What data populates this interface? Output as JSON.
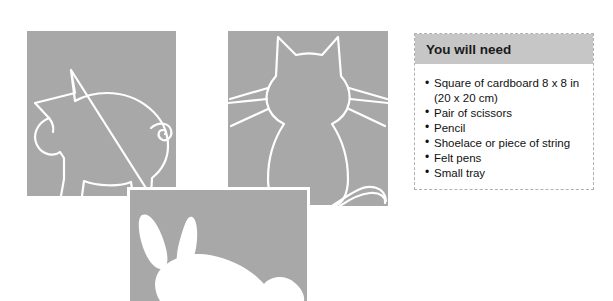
{
  "page": {
    "background_color": "#ffffff",
    "width": 613,
    "height": 301
  },
  "illustrations": {
    "square_fill_color": "#a8a8a8",
    "outline_color": "#ffffff",
    "items": [
      {
        "name": "pig",
        "style": "white-outline-drawing",
        "caption": ""
      },
      {
        "name": "cat",
        "style": "white-outline-drawing",
        "caption": ""
      },
      {
        "name": "rabbit",
        "style": "white-filled-silhouette",
        "caption": ""
      }
    ]
  },
  "materials": {
    "title": "You will need",
    "header_color": "#c6c6c6",
    "border_color": "#b0b0b0",
    "items": [
      {
        "text": "Square of cardboard 8 x 8 in",
        "continuation": "(20 x 20 cm)"
      },
      {
        "text": "Pair of scissors",
        "continuation": ""
      },
      {
        "text": "Pencil",
        "continuation": ""
      },
      {
        "text": "Shoelace or piece of string",
        "continuation": ""
      },
      {
        "text": "Felt pens",
        "continuation": ""
      },
      {
        "text": "Small tray",
        "continuation": ""
      }
    ]
  }
}
